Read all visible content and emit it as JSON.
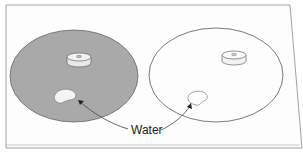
{
  "diagram": {
    "label_water": "Water",
    "colors": {
      "shaded_disc": "#a9a9a9",
      "outline": "#555555",
      "background": "#ffffff",
      "frame": "#888888"
    },
    "elements": [
      {
        "id": "left-disc",
        "fill": "shaded",
        "has_hub": true,
        "has_water_drop": true
      },
      {
        "id": "right-disc",
        "fill": "none",
        "has_hub": true,
        "has_water_drop": true
      }
    ]
  }
}
